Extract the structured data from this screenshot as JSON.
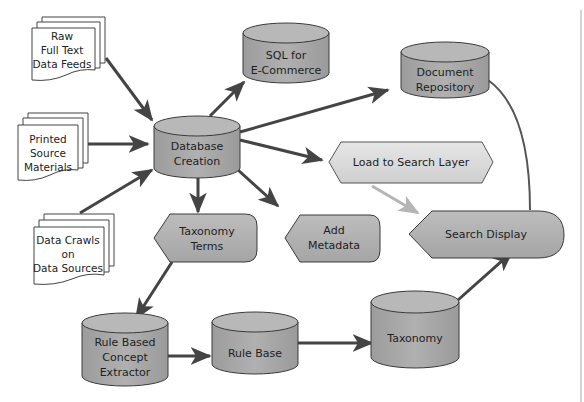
{
  "colors": {
    "cylinder_fill": "#a9a9a9",
    "cylinder_top": "#b8b8b8",
    "display_fill": "#b0b0b0",
    "load_fill": "#d8d8d8",
    "arrow": "#444444",
    "arrow_light": "#b5b5b5",
    "stroke": "#3a3a3a"
  },
  "documents": [
    {
      "id": "raw-feeds",
      "lines": [
        "Raw",
        "Full Text",
        "Data Feeds"
      ]
    },
    {
      "id": "printed",
      "lines": [
        "Printed",
        "Source",
        "Materials"
      ]
    },
    {
      "id": "crawls",
      "lines": [
        "Data Crawls",
        "on",
        "Data Sources"
      ]
    }
  ],
  "cylinders": [
    {
      "id": "sql",
      "lines": [
        "SQL for",
        "E-Commerce"
      ]
    },
    {
      "id": "db-creation",
      "lines": [
        "Database",
        "Creation"
      ]
    },
    {
      "id": "doc-repo",
      "lines": [
        "Document",
        "Repository"
      ]
    },
    {
      "id": "rule-extractor",
      "lines": [
        "Rule Based",
        "Concept",
        "Extractor"
      ]
    },
    {
      "id": "rule-base",
      "lines": [
        "Rule Base"
      ]
    },
    {
      "id": "taxonomy",
      "lines": [
        "Taxonomy"
      ]
    }
  ],
  "displays": [
    {
      "id": "load-search",
      "lines": [
        "Load to Search Layer"
      ]
    },
    {
      "id": "taxonomy-terms",
      "lines": [
        "Taxonomy",
        "Terms"
      ]
    },
    {
      "id": "add-metadata",
      "lines": [
        "Add",
        "Metadata"
      ]
    },
    {
      "id": "search-display",
      "lines": [
        "Search Display"
      ]
    }
  ]
}
